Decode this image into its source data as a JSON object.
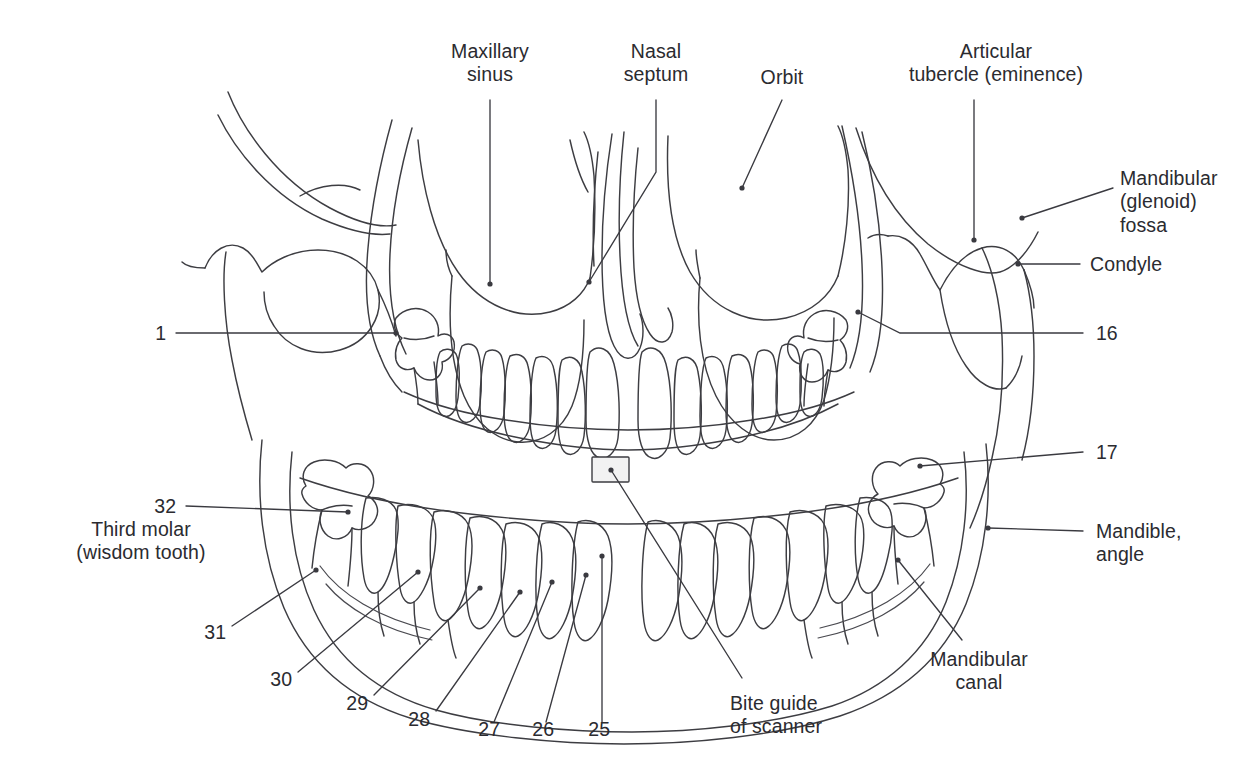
{
  "figure": {
    "ink_color": "#3d3d42",
    "text_color": "#2b2b30",
    "background_color": "#ffffff",
    "bite_guide_fill": "#f2f2f2"
  },
  "labels": {
    "maxillary_sinus": "Maxillary\nsinus",
    "nasal_septum": "Nasal\nseptum",
    "orbit": "Orbit",
    "articular_tubercle": "Articular\ntubercle (eminence)",
    "mandibular_fossa": "Mandibular\n(glenoid)\nfossa",
    "condyle": "Condyle",
    "mandible_angle": "Mandible,\nangle",
    "third_molar": "Third molar\n(wisdom tooth)",
    "bite_guide": "Bite guide\nof scanner",
    "mandibular_canal": "Mandibular\ncanal"
  },
  "tooth_numbers": {
    "upper_left": "1",
    "upper_right": "16",
    "lower_right_third_molar": "17",
    "lower_left_third_molar": "32",
    "n31": "31",
    "n30": "30",
    "n29": "29",
    "n28": "28",
    "n27": "27",
    "n26": "26",
    "n25": "25"
  },
  "callouts": [
    {
      "id": "maxillary-sinus",
      "label": "Maxillary\nsinus",
      "side": "top",
      "number": null
    },
    {
      "id": "nasal-septum",
      "label": "Nasal\nseptum",
      "side": "top",
      "number": null
    },
    {
      "id": "orbit",
      "label": "Orbit",
      "side": "top",
      "number": null
    },
    {
      "id": "articular-tubercle",
      "label": "Articular\ntubercle (eminence)",
      "side": "top",
      "number": null
    },
    {
      "id": "mandibular-fossa",
      "label": "Mandibular\n(glenoid)\nfossa",
      "side": "right",
      "number": null
    },
    {
      "id": "condyle",
      "label": "Condyle",
      "side": "right",
      "number": null
    },
    {
      "id": "tooth-16",
      "label": "16",
      "side": "right",
      "number": "16"
    },
    {
      "id": "tooth-17",
      "label": "17",
      "side": "right",
      "number": "17"
    },
    {
      "id": "mandible-angle",
      "label": "Mandible,\nangle",
      "side": "right",
      "number": null
    },
    {
      "id": "mandibular-canal",
      "label": "Mandibular\ncanal",
      "side": "bottom",
      "number": null
    },
    {
      "id": "tooth-1",
      "label": "1",
      "side": "left",
      "number": "1"
    },
    {
      "id": "tooth-32",
      "label": "32",
      "side": "left",
      "number": "32"
    },
    {
      "id": "third-molar",
      "label": "Third molar\n(wisdom tooth)",
      "side": "left",
      "number": null
    },
    {
      "id": "tooth-31",
      "label": "31",
      "side": "bottom",
      "number": "31"
    },
    {
      "id": "tooth-30",
      "label": "30",
      "side": "bottom",
      "number": "30"
    },
    {
      "id": "tooth-29",
      "label": "29",
      "side": "bottom",
      "number": "29"
    },
    {
      "id": "tooth-28",
      "label": "28",
      "side": "bottom",
      "number": "28"
    },
    {
      "id": "tooth-27",
      "label": "27",
      "side": "bottom",
      "number": "27"
    },
    {
      "id": "tooth-26",
      "label": "26",
      "side": "bottom",
      "number": "26"
    },
    {
      "id": "tooth-25",
      "label": "25",
      "side": "bottom",
      "number": "25"
    },
    {
      "id": "bite-guide",
      "label": "Bite guide\nof scanner",
      "side": "bottom",
      "number": null
    }
  ]
}
